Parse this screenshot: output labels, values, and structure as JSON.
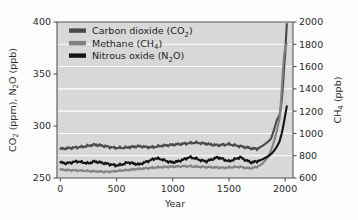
{
  "figure": {
    "title": "",
    "background_color": "#fdfdfd",
    "plot_background_color": "#d8d8d8",
    "gridline_color": "#ffffff",
    "axis_color": "#555555"
  },
  "axes": {
    "x": {
      "label": "Year",
      "ticks": [
        "0",
        "500",
        "1000",
        "1500",
        "2000"
      ],
      "tick_values": [
        0,
        500,
        1000,
        1500,
        2000
      ],
      "range": [
        -30,
        2070
      ]
    },
    "y_left": {
      "label_parts": {
        "a": "CO",
        "a_sub": "2",
        "b": " (ppm), N",
        "b_sub": "2",
        "c": "O (ppb)"
      },
      "label": "CO2 (ppm), N2O (ppb)",
      "ticks": [
        "250",
        "300",
        "350",
        "400"
      ],
      "tick_values": [
        250,
        300,
        350,
        400
      ],
      "range": [
        250,
        400
      ]
    },
    "y_right": {
      "label_parts": {
        "a": "CH",
        "a_sub": "4",
        "b": " (ppb)"
      },
      "label": "CH4 (ppb)",
      "ticks": [
        "600",
        "800",
        "1000",
        "1200",
        "1400",
        "1600",
        "1800",
        "2000"
      ],
      "tick_values": [
        600,
        800,
        1000,
        1200,
        1400,
        1600,
        1800,
        2000
      ],
      "range": [
        600,
        2000
      ]
    }
  },
  "legend": {
    "position": "top-left-inside",
    "items": [
      {
        "label_parts": {
          "text": "Carbon dioxide (CO",
          "sub": "2",
          "tail": ")"
        },
        "label": "Carbon dioxide (CO2)",
        "color": "#4a4a4a"
      },
      {
        "label_parts": {
          "text": "Methane (CH",
          "sub": "4",
          "tail": ")"
        },
        "label": "Methane (CH4)",
        "color": "#828282"
      },
      {
        "label_parts": {
          "text": "Nitrous oxide (N",
          "sub": "2",
          "tail": "O)"
        },
        "label": "Nitrous oxide (N2O)",
        "color": "#141414"
      }
    ]
  },
  "chart_data": {
    "type": "line",
    "xlabel": "Year",
    "ylabel": "CO2 (ppm), N2O (ppb)",
    "ylabel_right": "CH4 (ppb)",
    "xlim": [
      -30,
      2070
    ],
    "ylim": [
      250,
      400
    ],
    "ylim_right": [
      600,
      2000
    ],
    "grid": "horizontal",
    "legend_position": "upper left (inside plot)",
    "series": [
      {
        "name": "Carbon dioxide (CO2)",
        "axis": "left",
        "units": "ppm",
        "color": "#4a4a4a",
        "x": [
          0,
          50,
          100,
          150,
          200,
          250,
          300,
          350,
          400,
          450,
          500,
          550,
          600,
          650,
          700,
          750,
          800,
          850,
          900,
          950,
          1000,
          1050,
          1100,
          1150,
          1200,
          1250,
          1300,
          1350,
          1400,
          1450,
          1500,
          1550,
          1600,
          1650,
          1700,
          1750,
          1800,
          1850,
          1875,
          1900,
          1925,
          1950,
          1960,
          1970,
          1980,
          1990,
          2000,
          2005,
          2010,
          2015
        ],
        "y": [
          278,
          278.5,
          279,
          279.5,
          280,
          281,
          282,
          281.5,
          280.5,
          279.5,
          279,
          279,
          279.5,
          280,
          280.5,
          280,
          279.5,
          280,
          281,
          281.5,
          282,
          282.5,
          283,
          283.5,
          284,
          283.5,
          283,
          282,
          281.5,
          282,
          282.5,
          281.5,
          280.5,
          279.5,
          278.5,
          278,
          281,
          285,
          288,
          296,
          305,
          311,
          316,
          325,
          338,
          354,
          369,
          379,
          389,
          398
        ]
      },
      {
        "name": "Methane (CH4)",
        "axis": "right",
        "units": "ppb",
        "color": "#828282",
        "x": [
          0,
          50,
          100,
          150,
          200,
          250,
          300,
          350,
          400,
          450,
          500,
          550,
          600,
          650,
          700,
          750,
          800,
          850,
          900,
          950,
          1000,
          1050,
          1100,
          1150,
          1200,
          1250,
          1300,
          1350,
          1400,
          1450,
          1500,
          1550,
          1600,
          1650,
          1700,
          1750,
          1800,
          1850,
          1875,
          1900,
          1925,
          1950,
          1960,
          1970,
          1980,
          1990,
          2000,
          2005,
          2010,
          2015
        ],
        "y": [
          675,
          672,
          670,
          668,
          665,
          663,
          660,
          658,
          655,
          658,
          662,
          668,
          672,
          678,
          682,
          686,
          690,
          694,
          698,
          700,
          702,
          704,
          706,
          705,
          703,
          700,
          698,
          696,
          694,
          692,
          694,
          698,
          700,
          690,
          688,
          700,
          730,
          790,
          850,
          925,
          1020,
          1130,
          1250,
          1400,
          1570,
          1700,
          1760,
          1790,
          1800,
          1805
        ]
      },
      {
        "name": "Nitrous oxide (N2O)",
        "axis": "left",
        "units": "ppb",
        "color": "#141414",
        "x": [
          0,
          50,
          100,
          150,
          200,
          250,
          300,
          350,
          400,
          450,
          500,
          550,
          600,
          650,
          700,
          750,
          800,
          850,
          900,
          950,
          1000,
          1050,
          1100,
          1150,
          1200,
          1250,
          1300,
          1350,
          1400,
          1450,
          1500,
          1550,
          1600,
          1650,
          1700,
          1750,
          1800,
          1850,
          1875,
          1900,
          1925,
          1950,
          1960,
          1970,
          1980,
          1990,
          2000,
          2005,
          2010,
          2015
        ],
        "y": [
          265,
          264,
          265,
          266,
          265,
          264,
          266,
          265,
          264,
          263,
          262,
          263,
          265,
          264,
          263,
          265,
          267,
          269,
          268,
          266,
          265,
          266,
          268,
          270,
          269,
          267,
          266,
          268,
          270,
          268,
          266,
          268,
          270,
          267,
          265,
          266,
          268,
          271,
          273,
          276,
          280,
          285,
          289,
          293,
          298,
          304,
          310,
          313,
          316,
          319
        ]
      }
    ]
  }
}
